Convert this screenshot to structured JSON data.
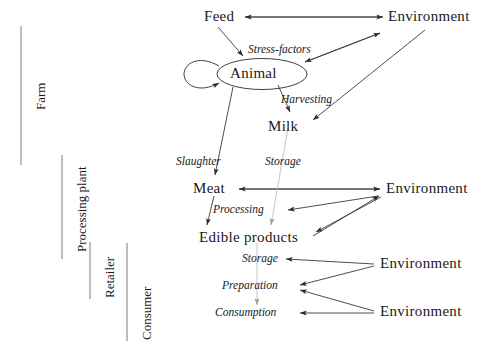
{
  "diagram": {
    "stage_labels": [
      {
        "id": "farm",
        "label": "Farm"
      },
      {
        "id": "processing-plant",
        "label": "Processing plant"
      },
      {
        "id": "retailer",
        "label": "Retailer"
      },
      {
        "id": "consumer",
        "label": "Consumer"
      }
    ],
    "nodes": [
      {
        "id": "feed",
        "label": "Feed"
      },
      {
        "id": "animal",
        "label": "Animal"
      },
      {
        "id": "milk",
        "label": "Milk"
      },
      {
        "id": "meat",
        "label": "Meat"
      },
      {
        "id": "edible-products",
        "label": "Edible products"
      },
      {
        "id": "environment-top",
        "label": "Environment"
      },
      {
        "id": "environment-mid",
        "label": "Environment"
      },
      {
        "id": "environment-lower",
        "label": "Environment"
      },
      {
        "id": "environment-bottom",
        "label": "Environment"
      }
    ],
    "process_labels": [
      {
        "id": "stress-factors",
        "label": "Stress-factors"
      },
      {
        "id": "harvesting",
        "label": "Harvesting"
      },
      {
        "id": "slaughter",
        "label": "Slaughter"
      },
      {
        "id": "storage-upper",
        "label": "Storage"
      },
      {
        "id": "processing",
        "label": "Processing"
      },
      {
        "id": "storage-lower",
        "label": "Storage"
      },
      {
        "id": "preparation",
        "label": "Preparation"
      },
      {
        "id": "consumption",
        "label": "Consumption"
      }
    ],
    "colors": {
      "ink": "#1a1a1a",
      "stroke": "#3a3a3a",
      "faint_stroke": "#b4b4b4",
      "bracket": "#6e6e6e",
      "background": "#ffffff"
    }
  }
}
